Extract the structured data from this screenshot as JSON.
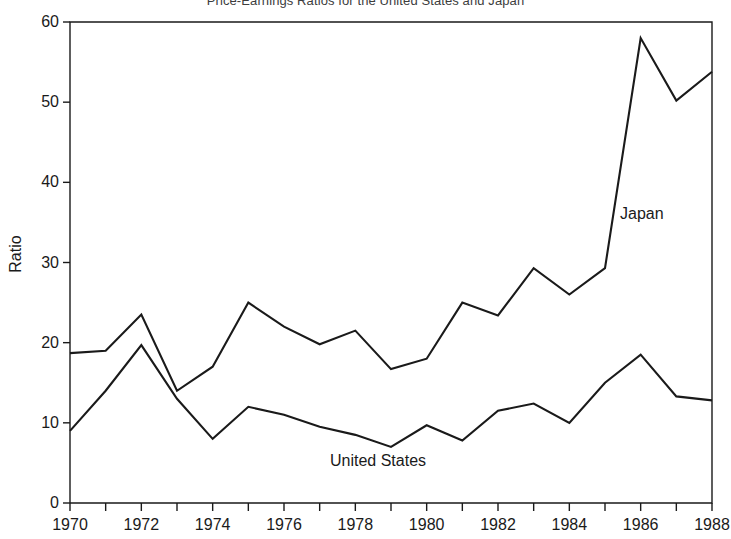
{
  "chart_data": {
    "type": "line",
    "title": "Price-Earnings Ratios for the United States and Japan",
    "xlabel": "",
    "ylabel": "Ratio",
    "xlim": [
      1970,
      1988
    ],
    "ylim": [
      0,
      60
    ],
    "grid": false,
    "legend_position": "inline-annotation",
    "x": [
      1970,
      1971,
      1972,
      1973,
      1974,
      1975,
      1976,
      1977,
      1978,
      1979,
      1980,
      1981,
      1982,
      1983,
      1984,
      1985,
      1986,
      1987,
      1988
    ],
    "y_ticks": [
      0,
      10,
      20,
      30,
      40,
      50,
      60
    ],
    "y_tick_labels": [
      "0",
      "10",
      "20",
      "30",
      "40",
      "50",
      "60"
    ],
    "x_ticks_major": [
      1970,
      1972,
      1974,
      1976,
      1978,
      1980,
      1982,
      1984,
      1986,
      1988
    ],
    "x_tick_labels": [
      "1970",
      "1972",
      "1974",
      "1976",
      "1978",
      "1980",
      "1982",
      "1984",
      "1986",
      "1988"
    ],
    "x_ticks_minor": [
      1971,
      1973,
      1975,
      1977,
      1979,
      1981,
      1983,
      1985,
      1987
    ],
    "series": [
      {
        "name": "Japan",
        "color": "#1a1a1a",
        "annotation": "Japan",
        "values": [
          18.7,
          19.0,
          23.5,
          14.0,
          17.0,
          25.0,
          22.0,
          19.8,
          21.5,
          16.7,
          18.0,
          25.0,
          23.4,
          29.3,
          26.0,
          29.3,
          58.0,
          50.2,
          53.8
        ]
      },
      {
        "name": "United States",
        "color": "#1a1a1a",
        "annotation": "United States",
        "values": [
          9.0,
          14.0,
          19.7,
          13.0,
          8.0,
          12.0,
          11.0,
          9.5,
          8.5,
          7.0,
          9.7,
          7.8,
          11.5,
          12.4,
          10.0,
          15.0,
          18.5,
          13.3,
          12.8
        ]
      }
    ]
  }
}
